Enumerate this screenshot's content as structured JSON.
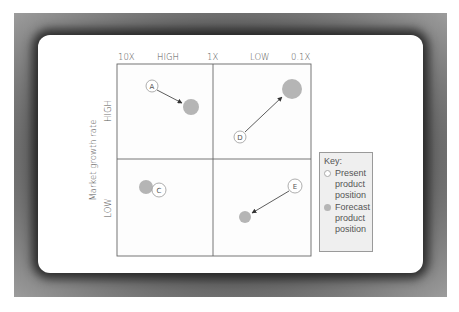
{
  "diagram": {
    "type": "growth-share-matrix",
    "x_axis": {
      "ticks": [
        "10X",
        "HIGH",
        "1X",
        "LOW",
        "0.1X"
      ]
    },
    "y_axis": {
      "title": "Market growth rate",
      "ticks": [
        "HIGH",
        "LOW"
      ]
    },
    "products": [
      {
        "id": "A",
        "label": "A",
        "quadrant": "high-growth / high-share",
        "movement": "present → forecast (down-right)"
      },
      {
        "id": "C",
        "label": "C",
        "quadrant": "low-growth / high-share",
        "movement": "forecast overlaps present (slight left)"
      },
      {
        "id": "D",
        "label": "D",
        "quadrant": "high-growth / low-share",
        "movement": "present → forecast (up-right, larger)"
      },
      {
        "id": "E",
        "label": "E",
        "quadrant": "low-growth / low-share",
        "movement": "present → forecast (down-left, smaller)"
      }
    ],
    "colors": {
      "present_fill": "#ffffff",
      "forecast_fill": "#b5b5b5",
      "grid_line": "#666666",
      "frame": "#8f8f8f"
    }
  },
  "key": {
    "title": "Key:",
    "items": [
      {
        "label": "Present product position",
        "symbol": "open-circle"
      },
      {
        "label": "Forecast product position",
        "symbol": "filled-gray-circle"
      }
    ]
  }
}
